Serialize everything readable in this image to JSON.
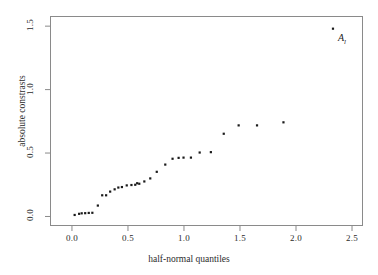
{
  "chart_data": {
    "type": "scatter",
    "title": "",
    "xlabel": "half-normal quantiles",
    "ylabel": "absolute constrasts",
    "xlim": [
      -0.196,
      2.598
    ],
    "ylim": [
      -0.075,
      1.58
    ],
    "xticks": [
      0.0,
      0.5,
      1.0,
      1.5,
      2.0,
      2.5
    ],
    "xticklabels": [
      "0.0",
      "0.5",
      "1.0",
      "1.5",
      "2.0",
      "2.5"
    ],
    "yticks": [
      0.0,
      0.5,
      1.0,
      1.5
    ],
    "yticklabels": [
      "0.0",
      "0.5",
      "1.0",
      "1.5"
    ],
    "grid": false,
    "legend": null,
    "marker": "square",
    "marker_color": "#1a1a1a",
    "marker_size": 2.2,
    "series": [
      {
        "name": "absolute contrasts",
        "points": [
          [
            0.024,
            0.012
          ],
          [
            0.064,
            0.021
          ],
          [
            0.087,
            0.025
          ],
          [
            0.118,
            0.026
          ],
          [
            0.15,
            0.028
          ],
          [
            0.182,
            0.029
          ],
          [
            0.231,
            0.086
          ],
          [
            0.27,
            0.167
          ],
          [
            0.305,
            0.167
          ],
          [
            0.341,
            0.196
          ],
          [
            0.381,
            0.214
          ],
          [
            0.414,
            0.228
          ],
          [
            0.446,
            0.232
          ],
          [
            0.489,
            0.245
          ],
          [
            0.531,
            0.248
          ],
          [
            0.565,
            0.25
          ],
          [
            0.582,
            0.262
          ],
          [
            0.601,
            0.258
          ],
          [
            0.646,
            0.276
          ],
          [
            0.699,
            0.3
          ],
          [
            0.757,
            0.352
          ],
          [
            0.833,
            0.409
          ],
          [
            0.898,
            0.455
          ],
          [
            0.952,
            0.462
          ],
          [
            0.996,
            0.464
          ],
          [
            1.062,
            0.464
          ],
          [
            1.14,
            0.504
          ],
          [
            1.24,
            0.507
          ],
          [
            1.355,
            0.652
          ],
          [
            1.488,
            0.718
          ],
          [
            1.652,
            0.718
          ],
          [
            1.888,
            0.742
          ],
          [
            2.33,
            1.48
          ]
        ]
      }
    ],
    "annotations": [
      {
        "text": "A",
        "subscript": "l",
        "x": 2.33,
        "y": 1.48,
        "style": "italic"
      }
    ]
  },
  "axis": {
    "xlabel": "half-normal quantiles",
    "ylabel": "absolute constrasts",
    "xticklabels": [
      "0.0",
      "0.5",
      "1.0",
      "1.5",
      "2.0",
      "2.5"
    ],
    "yticklabels": [
      "0.0",
      "0.5",
      "1.0",
      "1.5"
    ]
  },
  "annotation": {
    "label": "A",
    "subscript": "l"
  },
  "colors": {
    "marker": "#1a1a1a",
    "axis": "#8a8a8a",
    "text": "#2b2b2b",
    "background": "#ffffff"
  }
}
